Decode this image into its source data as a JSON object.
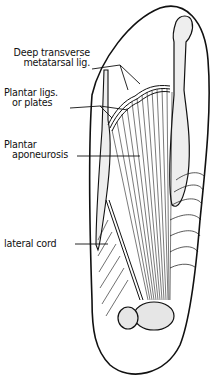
{
  "figure": {
    "labels": [
      {
        "id": "deep-transverse",
        "line1": "Deep transverse",
        "line2": "metatarsal lig."
      },
      {
        "id": "plantar-ligs",
        "line1": "Plantar ligs.",
        "line2": "or plates"
      },
      {
        "id": "plantar-aponeurosis",
        "line1": "Plantar",
        "line2": "aponeurosis"
      },
      {
        "id": "lateral-cord",
        "line1": "lateral cord"
      }
    ],
    "colors": {
      "ink": "#111111",
      "background": "#ffffff"
    }
  }
}
